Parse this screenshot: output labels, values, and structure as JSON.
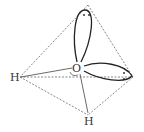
{
  "diagram": {
    "atoms": {
      "oxygen": "O",
      "hydrogen_left": "H",
      "hydrogen_bottom": "H"
    },
    "lone_pairs": [
      {
        "position": "top",
        "symbol": "··"
      },
      {
        "position": "right",
        "symbol": ":"
      }
    ],
    "colors": {
      "line": "#333333",
      "dashed": "#555555"
    }
  }
}
